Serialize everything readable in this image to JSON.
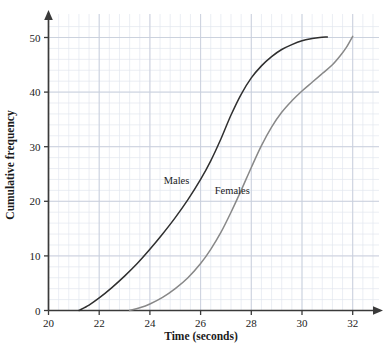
{
  "chart_data": {
    "type": "line",
    "title": "",
    "xlabel": "Time (seconds)",
    "ylabel": "Cumulative frequency",
    "xlim": [
      20,
      33.2
    ],
    "ylim": [
      0,
      53
    ],
    "xticks": [
      20,
      22,
      24,
      26,
      28,
      30,
      32
    ],
    "yticks": [
      0,
      10,
      20,
      30,
      40,
      50
    ],
    "xtick_labels": [
      "20",
      "22",
      "24",
      "26",
      "28",
      "30",
      "32"
    ],
    "ytick_labels": [
      "0",
      "10",
      "20",
      "30",
      "40",
      "50"
    ],
    "grid": true,
    "grid_minor_step_x": 0.4,
    "grid_minor_step_y": 2,
    "legend_position": "inline-annotation",
    "series": [
      {
        "name": "Males",
        "color": "#2f2f2f",
        "label_x": 25.05,
        "label_y": 23.2,
        "x": [
          21.2,
          21.6,
          22.0,
          22.5,
          23.0,
          23.5,
          24.0,
          24.5,
          25.0,
          25.5,
          26.0,
          26.4,
          26.8,
          27.2,
          27.6,
          28.0,
          28.4,
          28.8,
          29.2,
          29.6,
          30.0,
          30.4,
          30.7,
          31.0
        ],
        "y": [
          0,
          1.0,
          2.3,
          4.2,
          6.3,
          8.6,
          11.2,
          14.0,
          17.0,
          20.3,
          24.0,
          27.4,
          31.4,
          35.8,
          39.6,
          42.6,
          44.8,
          46.5,
          47.8,
          48.7,
          49.4,
          49.8,
          50.0,
          50.1
        ]
      },
      {
        "name": "Females",
        "color": "#888888",
        "label_x": 27.25,
        "label_y": 21.3,
        "x": [
          23.2,
          23.6,
          24.0,
          24.5,
          25.0,
          25.5,
          26.0,
          26.4,
          26.8,
          27.2,
          27.6,
          28.0,
          28.4,
          28.8,
          29.2,
          29.6,
          30.0,
          30.4,
          30.8,
          31.2,
          31.5,
          31.75,
          31.9,
          32.0
        ],
        "y": [
          0,
          0.5,
          1.2,
          2.4,
          4.0,
          6.0,
          8.6,
          11.2,
          14.3,
          18.0,
          22.0,
          26.2,
          30.2,
          33.6,
          36.3,
          38.4,
          40.2,
          41.8,
          43.4,
          45.0,
          46.6,
          48.2,
          49.4,
          50.2
        ]
      }
    ],
    "annotations": [
      {
        "text": "Males",
        "x": 25.05,
        "y": 23.2
      },
      {
        "text": "Females",
        "x": 27.25,
        "y": 21.3
      }
    ],
    "colors": {
      "background": "#ffffff",
      "axis": "#3a3a3a",
      "grid_minor": "#e3e7ef",
      "grid_major": "#c7cedb",
      "text": "#1b1b1b"
    }
  }
}
